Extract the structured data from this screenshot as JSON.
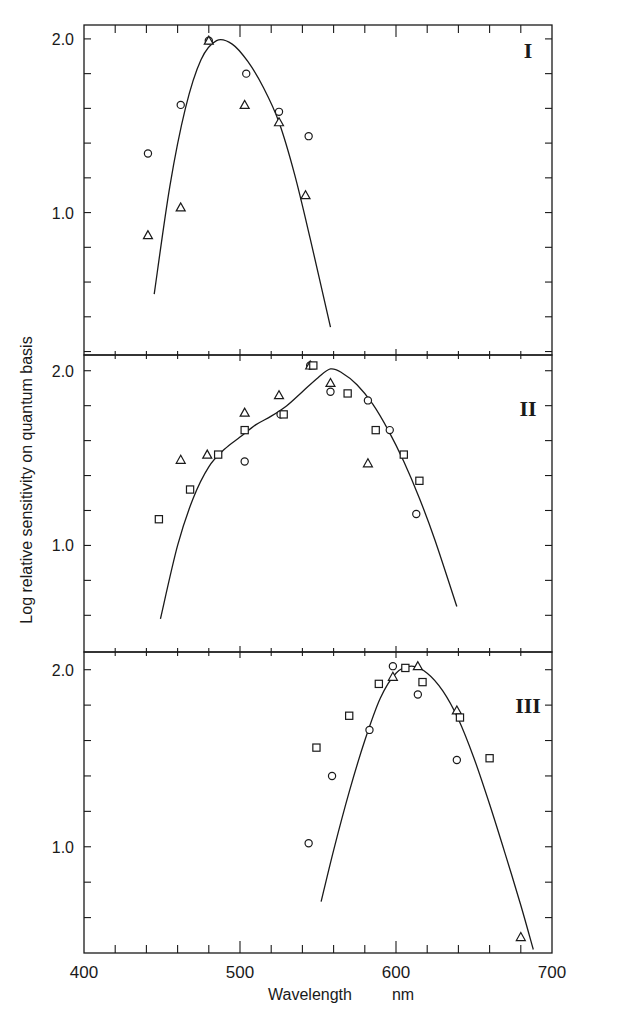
{
  "chart_data": {
    "type": "scatter",
    "title": "",
    "xlabel": "Wavelength",
    "xlabel_unit": "nm",
    "ylabel": "Log relative sensitivity on quantum basis",
    "xlim": [
      400,
      700
    ],
    "x_ticks": [
      400,
      500,
      600,
      700
    ],
    "x_minor_step": 20,
    "legend": "none (markers: circle, triangle, square)",
    "grid": false,
    "panels": [
      {
        "label": "I",
        "ylim": [
          0.18,
          2.08
        ],
        "y_ticks": [
          1.0,
          2.0
        ],
        "y_minor_step": 0.2,
        "fitted_curve": {
          "x": [
            445,
            455,
            465,
            475,
            485,
            495,
            505,
            515,
            525,
            535,
            545,
            558
          ],
          "y": [
            0.53,
            1.15,
            1.6,
            1.88,
            1.99,
            1.97,
            1.87,
            1.72,
            1.52,
            1.22,
            0.85,
            0.34
          ]
        },
        "series": [
          {
            "name": "circle",
            "points": [
              [
                441,
                1.34
              ],
              [
                462,
                1.62
              ],
              [
                480,
                1.99
              ],
              [
                504,
                1.8
              ],
              [
                525,
                1.58
              ],
              [
                544,
                1.44
              ]
            ]
          },
          {
            "name": "triangle",
            "points": [
              [
                441,
                0.87
              ],
              [
                462,
                1.03
              ],
              [
                480,
                1.99
              ],
              [
                503,
                1.62
              ],
              [
                525,
                1.52
              ],
              [
                542,
                1.1
              ]
            ]
          },
          {
            "name": "square",
            "points": []
          }
        ]
      },
      {
        "label": "II",
        "ylim": [
          0.39,
          2.09
        ],
        "y_ticks": [
          1.0,
          2.0
        ],
        "y_minor_step": 0.2,
        "fitted_curve": {
          "x": [
            449,
            460,
            470,
            480,
            490,
            500,
            510,
            520,
            530,
            540,
            550,
            558,
            565,
            575,
            585,
            595,
            605,
            615,
            625,
            639
          ],
          "y": [
            0.58,
            1.0,
            1.27,
            1.45,
            1.55,
            1.62,
            1.69,
            1.74,
            1.8,
            1.88,
            1.96,
            2.01,
            1.99,
            1.92,
            1.81,
            1.66,
            1.48,
            1.27,
            1.03,
            0.65
          ]
        },
        "series": [
          {
            "name": "circle",
            "points": [
              [
                503,
                1.48
              ],
              [
                526,
                1.75
              ],
              [
                545,
                2.03
              ],
              [
                558,
                1.88
              ],
              [
                582,
                1.83
              ],
              [
                596,
                1.66
              ],
              [
                613,
                1.18
              ]
            ]
          },
          {
            "name": "triangle",
            "points": [
              [
                462,
                1.49
              ],
              [
                479,
                1.52
              ],
              [
                503,
                1.76
              ],
              [
                525,
                1.86
              ],
              [
                545,
                2.03
              ],
              [
                558,
                1.93
              ],
              [
                582,
                1.47
              ]
            ]
          },
          {
            "name": "square",
            "points": [
              [
                448,
                1.15
              ],
              [
                468,
                1.32
              ],
              [
                486,
                1.52
              ],
              [
                503,
                1.66
              ],
              [
                528,
                1.75
              ],
              [
                547,
                2.03
              ],
              [
                569,
                1.87
              ],
              [
                587,
                1.66
              ],
              [
                605,
                1.52
              ],
              [
                615,
                1.37
              ]
            ]
          }
        ]
      },
      {
        "label": "III",
        "ylim": [
          0.4,
          2.1
        ],
        "y_ticks": [
          1.0,
          2.0
        ],
        "y_minor_step": 0.2,
        "fitted_curve": {
          "x": [
            552,
            560,
            570,
            580,
            590,
            600,
            610,
            620,
            630,
            640,
            650,
            660,
            670,
            680,
            688
          ],
          "y": [
            0.69,
            0.98,
            1.31,
            1.6,
            1.84,
            1.98,
            2.02,
            1.98,
            1.88,
            1.72,
            1.5,
            1.24,
            0.96,
            0.67,
            0.42
          ]
        },
        "series": [
          {
            "name": "circle",
            "points": [
              [
                544,
                1.02
              ],
              [
                559,
                1.4
              ],
              [
                583,
                1.66
              ],
              [
                598,
                2.02
              ],
              [
                614,
                1.86
              ],
              [
                639,
                1.49
              ]
            ]
          },
          {
            "name": "triangle",
            "points": [
              [
                598,
                1.96
              ],
              [
                614,
                2.02
              ],
              [
                639,
                1.77
              ],
              [
                680,
                0.49
              ]
            ]
          },
          {
            "name": "square",
            "points": [
              [
                549,
                1.56
              ],
              [
                570,
                1.74
              ],
              [
                589,
                1.92
              ],
              [
                606,
                2.01
              ],
              [
                617,
                1.93
              ],
              [
                641,
                1.73
              ],
              [
                660,
                1.5
              ]
            ]
          }
        ]
      }
    ]
  },
  "axes": {
    "x_tick_labels": [
      "400",
      "500",
      "600",
      "700"
    ],
    "y_tick_labels": [
      "1.0",
      "2.0"
    ],
    "xlabel": "Wavelength",
    "xunit": "nm",
    "ylabel": "Log relative sensitivity on quantum basis"
  },
  "panel_labels": [
    "I",
    "II",
    "III"
  ]
}
